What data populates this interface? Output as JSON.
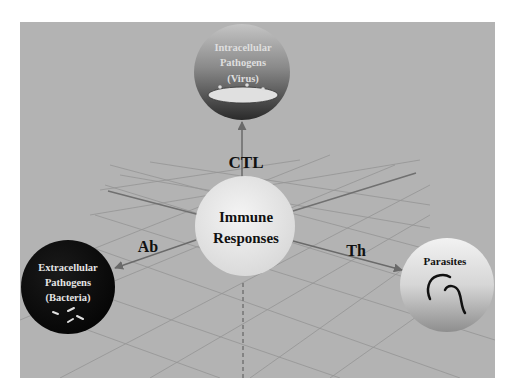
{
  "diagram": {
    "center": {
      "line1": "Immune",
      "line2": "Responses"
    },
    "top_node": {
      "line1": "Intracellular",
      "line2": "Pathogens",
      "line3": "(Virus)"
    },
    "left_node": {
      "line1": "Extracellular",
      "line2": "Pathogens",
      "line3": "(Bacteria)"
    },
    "right_node": {
      "line1": "Parasites"
    },
    "edges": {
      "top": "CTL",
      "left": "Ab",
      "right": "Th"
    },
    "colors": {
      "panel": "#b2b2b2",
      "grid": "#8f8f8f",
      "axis": "#6e6e6e",
      "center_fill": "#ececec",
      "left_fill": "#111111",
      "text_dark": "#111111",
      "text_light": "#e6e6e6"
    }
  }
}
